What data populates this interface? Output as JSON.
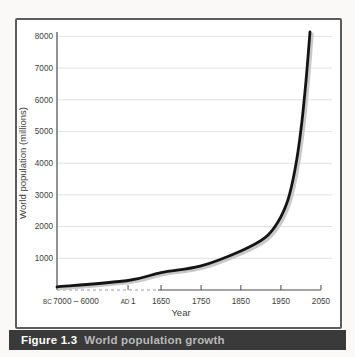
{
  "colors": {
    "page_background": "#faf9f7",
    "plot_background": "#ffffff",
    "frame_border": "#5c5c5c",
    "grid": "#e2e2e2",
    "axis": "#4a4a4a",
    "text": "#3c3c3c",
    "curve": "#141414",
    "curve_shadow": "#c9c9c9",
    "dashed_baseline": "#9a9a9a",
    "caption_bar": "#3a3a3a",
    "caption_label": "#ffffff",
    "caption_title": "#b9b9b9"
  },
  "caption": {
    "figure_label": "Figure 1.3",
    "title": "World population growth"
  },
  "chart_data": {
    "type": "line",
    "title": "World population growth",
    "xlabel": "Year",
    "ylabel": "World population (millions)",
    "ylim": [
      0,
      8400
    ],
    "grid": "horizontal only",
    "legend": "none",
    "x_axis_note": "nonlinear time axis: compressed from 7000-6000 BC to AD 1, then linear 100-year steps from 1650 to 2050; baseline dashed before 1650",
    "y_ticks": [
      1000,
      2000,
      3000,
      4000,
      5000,
      6000,
      7000,
      8000
    ],
    "x_ticks": [
      {
        "prefix": "BC",
        "label": "7000 – 6000",
        "pos": 0.0,
        "tick": false,
        "align": "left"
      },
      {
        "prefix": "AD",
        "label": "1",
        "pos": 0.252,
        "tick": true,
        "align": "center"
      },
      {
        "prefix": "",
        "label": "1650",
        "pos": 0.369,
        "tick": true,
        "align": "center"
      },
      {
        "prefix": "",
        "label": "1750",
        "pos": 0.511,
        "tick": true,
        "align": "center"
      },
      {
        "prefix": "",
        "label": "1850",
        "pos": 0.652,
        "tick": true,
        "align": "center"
      },
      {
        "prefix": "",
        "label": "1950",
        "pos": 0.794,
        "tick": true,
        "align": "center"
      },
      {
        "prefix": "",
        "label": "2050",
        "pos": 0.936,
        "tick": true,
        "align": "center"
      }
    ],
    "series": [
      {
        "name": "World population",
        "points": [
          [
            0.0,
            100
          ],
          [
            0.252,
            300
          ],
          [
            0.369,
            550
          ],
          [
            0.511,
            760
          ],
          [
            0.652,
            1230
          ],
          [
            0.738,
            1650
          ],
          [
            0.784,
            2150
          ],
          [
            0.819,
            2850
          ],
          [
            0.844,
            3800
          ],
          [
            0.865,
            5050
          ],
          [
            0.883,
            6600
          ],
          [
            0.897,
            8140
          ]
        ]
      }
    ],
    "readings": [
      {
        "year": "7000–6000 BC",
        "population_millions": 100
      },
      {
        "year": "AD 1",
        "population_millions": 300
      },
      {
        "year": "1650",
        "population_millions": 550
      },
      {
        "year": "1750",
        "population_millions": 760
      },
      {
        "year": "1850",
        "population_millions": 1230
      },
      {
        "year": "1950",
        "population_millions": 2300
      },
      {
        "year": "2000",
        "population_millions": 5100
      },
      {
        "year": "2020 (curve end)",
        "population_millions": 8140
      }
    ],
    "layout": {
      "axis_x": 42,
      "axis_top_y": 14,
      "zero_y": 272,
      "px_per_unit": 0.0317,
      "axis_length": 282,
      "grid_right_x": 317,
      "tick_len": 5,
      "tick_label_y": 286,
      "tick_font": 8.2,
      "prefix_font": 6.3,
      "xlabel_x": 166,
      "xlabel_y": 298,
      "xlabel_font": 9.5,
      "ylabel_x": 11,
      "ylabel_y": 145,
      "ylabel_font": 9.5,
      "dashed_from": 0.0,
      "dashed_to": 0.358,
      "solid_from": 0.358,
      "solid_to": 0.936,
      "curve_width": 2.8,
      "shadow_width": 3.2,
      "shadow_dx": 2.2,
      "shadow_dy": 2.0
    }
  }
}
